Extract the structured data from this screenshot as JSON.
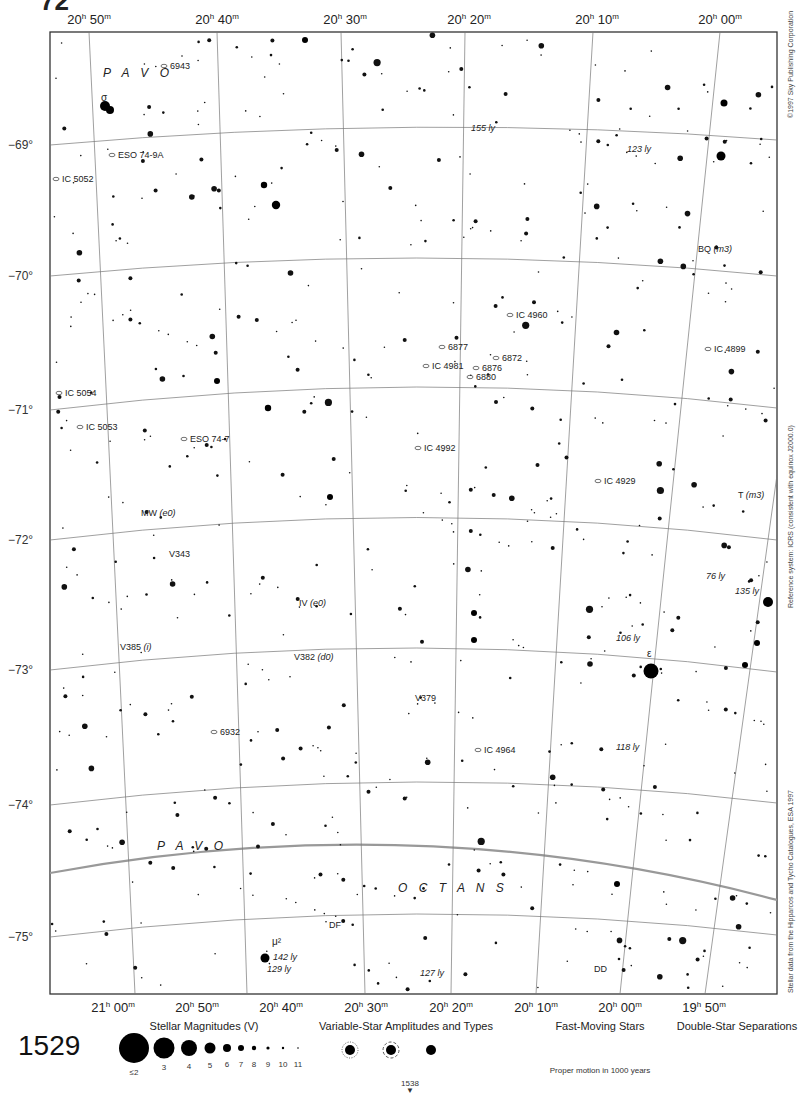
{
  "chart": {
    "page_number": "1529",
    "next_page_ref": "1538",
    "ra_labels_top": [
      {
        "text": "20h 50m",
        "h": "20",
        "m": "50",
        "x": 89
      },
      {
        "text": "20h 40m",
        "h": "20",
        "m": "40",
        "x": 217
      },
      {
        "text": "20h 30m",
        "h": "20",
        "m": "30",
        "x": 345
      },
      {
        "text": "20h 20m",
        "h": "20",
        "m": "20",
        "x": 469
      },
      {
        "text": "20h 10m",
        "h": "20",
        "m": "10",
        "x": 597
      },
      {
        "text": "20h 00m",
        "h": "20",
        "m": "00",
        "x": 720
      }
    ],
    "ra_labels_bottom": [
      {
        "text": "21h 00m",
        "h": "21",
        "m": "00",
        "x": 113
      },
      {
        "text": "20h 50m",
        "h": "20",
        "m": "50",
        "x": 197
      },
      {
        "text": "20h 40m",
        "h": "20",
        "m": "40",
        "x": 281
      },
      {
        "text": "20h 30m",
        "h": "20",
        "m": "30",
        "x": 366
      },
      {
        "text": "20h 20m",
        "h": "20",
        "m": "20",
        "x": 451
      },
      {
        "text": "20h 10m",
        "h": "20",
        "m": "10",
        "x": 536
      },
      {
        "text": "20h 00m",
        "h": "20",
        "m": "00",
        "x": 620
      },
      {
        "text": "19h 50m",
        "h": "19",
        "m": "50",
        "x": 704
      }
    ],
    "dec_labels": [
      {
        "text": "−69°",
        "y": 145
      },
      {
        "text": "−70°",
        "y": 276
      },
      {
        "text": "−71°",
        "y": 410
      },
      {
        "text": "−72°",
        "y": 540
      },
      {
        "text": "−73°",
        "y": 670
      },
      {
        "text": "−74°",
        "y": 805
      },
      {
        "text": "−75°",
        "y": 937
      }
    ],
    "constellations": [
      {
        "name": "PAVO",
        "x": 103,
        "y": 77
      },
      {
        "name": "PAVO",
        "x": 157,
        "y": 850
      },
      {
        "name": "OCTANS",
        "x": 398,
        "y": 892
      }
    ],
    "objects": [
      {
        "label": "6943",
        "x": 170,
        "y": 69,
        "type": "galaxy"
      },
      {
        "label": "ESO 74-9A",
        "x": 118,
        "y": 158,
        "type": "galaxy"
      },
      {
        "label": "IC 5052",
        "x": 62,
        "y": 182,
        "type": "galaxy"
      },
      {
        "label": "IC 4960",
        "x": 516,
        "y": 318,
        "type": "galaxy"
      },
      {
        "label": "6877",
        "x": 448,
        "y": 350,
        "type": "galaxy"
      },
      {
        "label": "6872",
        "x": 502,
        "y": 361,
        "type": "galaxy"
      },
      {
        "label": "IC 4981",
        "x": 432,
        "y": 369,
        "type": "galaxy"
      },
      {
        "label": "6876",
        "x": 482,
        "y": 371,
        "type": "galaxy"
      },
      {
        "label": "6880",
        "x": 476,
        "y": 380,
        "type": "galaxy"
      },
      {
        "label": "IC 4899",
        "x": 714,
        "y": 352,
        "type": "galaxy"
      },
      {
        "label": "IC 5054",
        "x": 65,
        "y": 396,
        "type": "galaxy"
      },
      {
        "label": "IC 5053",
        "x": 86,
        "y": 430,
        "type": "galaxy"
      },
      {
        "label": "ESO 74-7",
        "x": 190,
        "y": 442,
        "type": "galaxy"
      },
      {
        "label": "IC 4992",
        "x": 424,
        "y": 451,
        "type": "galaxy"
      },
      {
        "label": "IC 4929",
        "x": 604,
        "y": 484,
        "type": "galaxy"
      },
      {
        "label": "6932",
        "x": 220,
        "y": 735,
        "type": "galaxy"
      },
      {
        "label": "IC 4964",
        "x": 484,
        "y": 753,
        "type": "galaxy"
      }
    ],
    "variable_stars": [
      {
        "label": "BQ",
        "type_code": "(m3)",
        "x": 698,
        "y": 252
      },
      {
        "label": "T",
        "type_code": "(m3)",
        "x": 738,
        "y": 498
      },
      {
        "label": "MW",
        "type_code": "(e0)",
        "x": 141,
        "y": 516
      },
      {
        "label": "V343",
        "type_code": "",
        "x": 169,
        "y": 557
      },
      {
        "label": "IV",
        "type_code": "(e0)",
        "x": 299,
        "y": 606
      },
      {
        "label": "V385",
        "type_code": "(i)",
        "x": 120,
        "y": 650
      },
      {
        "label": "V382",
        "type_code": "(d0)",
        "x": 294,
        "y": 660
      },
      {
        "label": "V379",
        "type_code": "",
        "x": 415,
        "y": 701
      },
      {
        "label": "DF",
        "type_code": "",
        "x": 329,
        "y": 928
      },
      {
        "label": "DD",
        "type_code": "",
        "x": 594,
        "y": 972
      }
    ],
    "named_stars": [
      {
        "label": "σ",
        "x": 101,
        "y": 101
      },
      {
        "label": "ε",
        "x": 647,
        "y": 657
      },
      {
        "label": "μ²",
        "x": 272,
        "y": 945
      }
    ],
    "distances": [
      {
        "label": "155 ly",
        "x": 471,
        "y": 131
      },
      {
        "label": "123 ly",
        "x": 627,
        "y": 152
      },
      {
        "label": "76 ly",
        "x": 706,
        "y": 579
      },
      {
        "label": "135 ly",
        "x": 735,
        "y": 594
      },
      {
        "label": "106 ly",
        "x": 616,
        "y": 641
      },
      {
        "label": "118 ly",
        "x": 616,
        "y": 750
      },
      {
        "label": "142 ly",
        "x": 273,
        "y": 960
      },
      {
        "label": "129 ly",
        "x": 267,
        "y": 972
      },
      {
        "label": "127 ly",
        "x": 420,
        "y": 976
      }
    ]
  },
  "side_credits": {
    "copyright": "©1997 Sky Publishing Corporation",
    "reference_system": "Reference system: ICRS (consistent with equinox J2000.0)",
    "data_source": "Stellar data from the Hipparcos and Tycho Catalogues, ESA 1997"
  },
  "legend": {
    "magnitudes": {
      "title": "Stellar Magnitudes (V)",
      "items": [
        {
          "label": "≤2",
          "r": 15
        },
        {
          "label": "3",
          "r": 10.5
        },
        {
          "label": "4",
          "r": 8
        },
        {
          "label": "5",
          "r": 5.5
        },
        {
          "label": "6",
          "r": 4
        },
        {
          "label": "7",
          "r": 3
        },
        {
          "label": "8",
          "r": 2.2
        },
        {
          "label": "9",
          "r": 1.6
        },
        {
          "label": "10",
          "r": 1.2
        },
        {
          "label": "11",
          "r": 0.8
        }
      ]
    },
    "variables": {
      "title": "Variable-Star Amplitudes and Types",
      "amplitudes": [
        "<0.1 mag",
        "0.1 – 1.0",
        "≥1.0 mag"
      ],
      "types": [
        {
          "code": "(e)",
          "label": "Eclipsing"
        },
        {
          "code": "(c)",
          "label": "Cepheid"
        },
        {
          "code": "(m)",
          "label": "Mira"
        },
        {
          "code": "",
          "label": "... etc."
        }
      ]
    },
    "fast_moving": {
      "title": "Fast-Moving Stars",
      "caption": "Proper motion in 1000 years"
    },
    "double_stars": {
      "title": "Double-Star Separations",
      "separations": [
        "0.3\"",
        "3\"",
        "30\""
      ]
    }
  }
}
